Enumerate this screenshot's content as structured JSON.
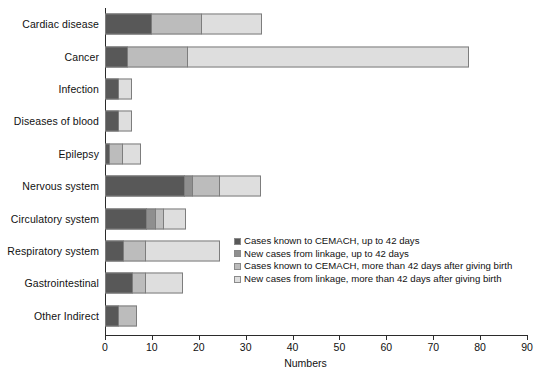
{
  "chart_data": {
    "type": "bar",
    "orientation": "horizontal",
    "stacked": true,
    "title": "",
    "xlabel": "Numbers",
    "ylabel": "",
    "xlim": [
      0,
      90
    ],
    "xticks": [
      0,
      10,
      20,
      30,
      40,
      50,
      60,
      70,
      80,
      90
    ],
    "grid": false,
    "legend_position": "inside-center-right",
    "categories": [
      "Cardiac disease",
      "Cancer",
      "Infection",
      "Diseases of blood",
      "Epilepsy",
      "Nervous system",
      "Circulatory system",
      "Respiratory system",
      "Gastrointestinal",
      "Other Indirect"
    ],
    "series": [
      {
        "name": "Cases known to CEMACH, up to 42 days",
        "color": "#585858",
        "values": [
          10,
          5,
          3,
          3,
          1,
          17,
          9,
          4,
          6,
          3
        ]
      },
      {
        "name": "New cases from linkage, up to 42 days",
        "color": "#8f8f8f",
        "values": [
          0,
          0,
          0,
          0,
          0,
          2,
          2,
          0,
          0,
          0
        ]
      },
      {
        "name": "Cases known to CEMACH, more than 42 days after giving birth",
        "color": "#bcbcbc",
        "values": [
          11,
          13,
          0,
          0,
          3,
          6,
          2,
          5,
          3,
          4
        ]
      },
      {
        "name": "New cases from linkage, more than 42 days after giving birth",
        "color": "#dedede",
        "values": [
          13,
          60,
          3,
          3,
          4,
          9,
          5,
          16,
          8,
          0
        ]
      }
    ],
    "totals": [
      34,
      78,
      6,
      6,
      8,
      34,
      18,
      25,
      17,
      7
    ]
  },
  "legend": {
    "items": [
      {
        "label": "Cases known to CEMACH, up to 42 days",
        "color": "#585858"
      },
      {
        "label": "New cases from linkage, up to 42 days",
        "color": "#8f8f8f"
      },
      {
        "label": "Cases known to CEMACH, more than 42 days after giving birth",
        "color": "#bcbcbc"
      },
      {
        "label": "New cases from linkage, more than 42 days after giving birth",
        "color": "#dedede"
      }
    ]
  }
}
